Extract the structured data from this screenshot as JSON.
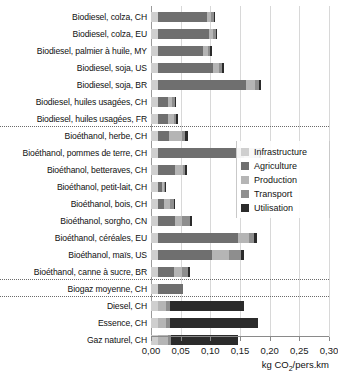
{
  "title_sliver": "",
  "axis": {
    "xlabel_main": "kg CO",
    "xlabel_sub": "2",
    "xlabel_tail": "/pers.km",
    "ticks": [
      "0,00",
      "0,05",
      "0,10",
      "0,15",
      "0,20",
      "0,25",
      "0,30"
    ],
    "xmin": 0,
    "xmax": 0.3
  },
  "legend": {
    "items": [
      {
        "label": "Infrastructure",
        "color": "#cfcfcf"
      },
      {
        "label": "Agriculture",
        "color": "#6f6f6f"
      },
      {
        "label": "Production",
        "color": "#b5b5b5"
      },
      {
        "label": "Transport",
        "color": "#8e8e8e"
      },
      {
        "label": "Utilisation",
        "color": "#2b2b2b"
      }
    ]
  },
  "chart_data": {
    "type": "bar",
    "orientation": "horizontal",
    "stacked": true,
    "title": "",
    "xlabel": "kg CO2/pers.km",
    "ylabel": "",
    "xlim": [
      0,
      0.3
    ],
    "xticks": [
      0,
      0.05,
      0.1,
      0.15,
      0.2,
      0.25,
      0.3
    ],
    "grid": "vertical",
    "legend_position": "right",
    "series": [
      {
        "name": "Infrastructure",
        "color": "#cfcfcf"
      },
      {
        "name": "Agriculture",
        "color": "#6f6f6f"
      },
      {
        "name": "Production",
        "color": "#b5b5b5"
      },
      {
        "name": "Transport",
        "color": "#8e8e8e"
      },
      {
        "name": "Utilisation",
        "color": "#2b2b2b"
      }
    ],
    "groups": [
      {
        "name": "Biodiesel",
        "rows": [
          {
            "label": "Biodiesel, colza, CH",
            "values": [
              0.012,
              0.082,
              0.008,
              0.004,
              0.002
            ]
          },
          {
            "label": "Biodiesel, colza, EU",
            "values": [
              0.012,
              0.085,
              0.008,
              0.004,
              0.002
            ]
          },
          {
            "label": "Biodiesel, palmier à huile, MY",
            "values": [
              0.012,
              0.076,
              0.008,
              0.004,
              0.003
            ]
          },
          {
            "label": "Biodiesel, soja, US",
            "values": [
              0.012,
              0.092,
              0.01,
              0.006,
              0.003
            ]
          },
          {
            "label": "Biodiesel, soja, BR",
            "values": [
              0.012,
              0.148,
              0.016,
              0.006,
              0.004
            ]
          },
          {
            "label": "Biodiesel, huiles usagées, CH",
            "values": [
              0.012,
              0.016,
              0.008,
              0.004,
              0.003
            ]
          },
          {
            "label": "Biodiesel, huiles usagées, FR",
            "values": [
              0.012,
              0.016,
              0.01,
              0.005,
              0.003
            ]
          }
        ]
      },
      {
        "name": "Bioéthanol",
        "rows": [
          {
            "label": "Bioéthanol, herbe, CH",
            "values": [
              0.012,
              0.018,
              0.022,
              0.006,
              0.004
            ]
          },
          {
            "label": "Bioéthanol, pommes de terre, CH",
            "values": [
              0.012,
              0.144,
              0.018,
              0.008,
              0.004
            ]
          },
          {
            "label": "Bioéthanol, betteraves, CH",
            "values": [
              0.012,
              0.028,
              0.014,
              0.004,
              0.003
            ]
          },
          {
            "label": "Bioéthanol, petit-lait, CH",
            "values": [
              0.012,
              0.006,
              0.004,
              0.002,
              0.002
            ]
          },
          {
            "label": "Bioéthanol, bois, CH",
            "values": [
              0.012,
              0.01,
              0.01,
              0.006,
              0.003
            ]
          },
          {
            "label": "Bioéthanol, sorgho, CN",
            "values": [
              0.012,
              0.028,
              0.012,
              0.014,
              0.004
            ]
          },
          {
            "label": "Bioéthanol, céréales, EU",
            "values": [
              0.012,
              0.134,
              0.02,
              0.008,
              0.004
            ]
          },
          {
            "label": "Bioéthanol, maïs, US",
            "values": [
              0.012,
              0.09,
              0.03,
              0.02,
              0.004
            ]
          },
          {
            "label": "Bioéthanol, canne à sucre, BR",
            "values": [
              0.012,
              0.026,
              0.014,
              0.01,
              0.004
            ]
          }
        ]
      },
      {
        "name": "Biogaz",
        "rows": [
          {
            "label": "Biogaz moyenne, CH",
            "values": [
              0.012,
              0.042,
              0.0,
              0.0,
              0.0
            ]
          }
        ]
      },
      {
        "name": "Fossiles",
        "rows": [
          {
            "label": "Diesel, CH",
            "values": [
              0.012,
              0.0,
              0.014,
              0.006,
              0.124
            ]
          },
          {
            "label": "Essence, CH",
            "values": [
              0.012,
              0.0,
              0.014,
              0.006,
              0.148
            ]
          },
          {
            "label": "Gaz naturel, CH",
            "values": [
              0.012,
              0.0,
              0.016,
              0.006,
              0.112
            ]
          }
        ]
      }
    ]
  }
}
